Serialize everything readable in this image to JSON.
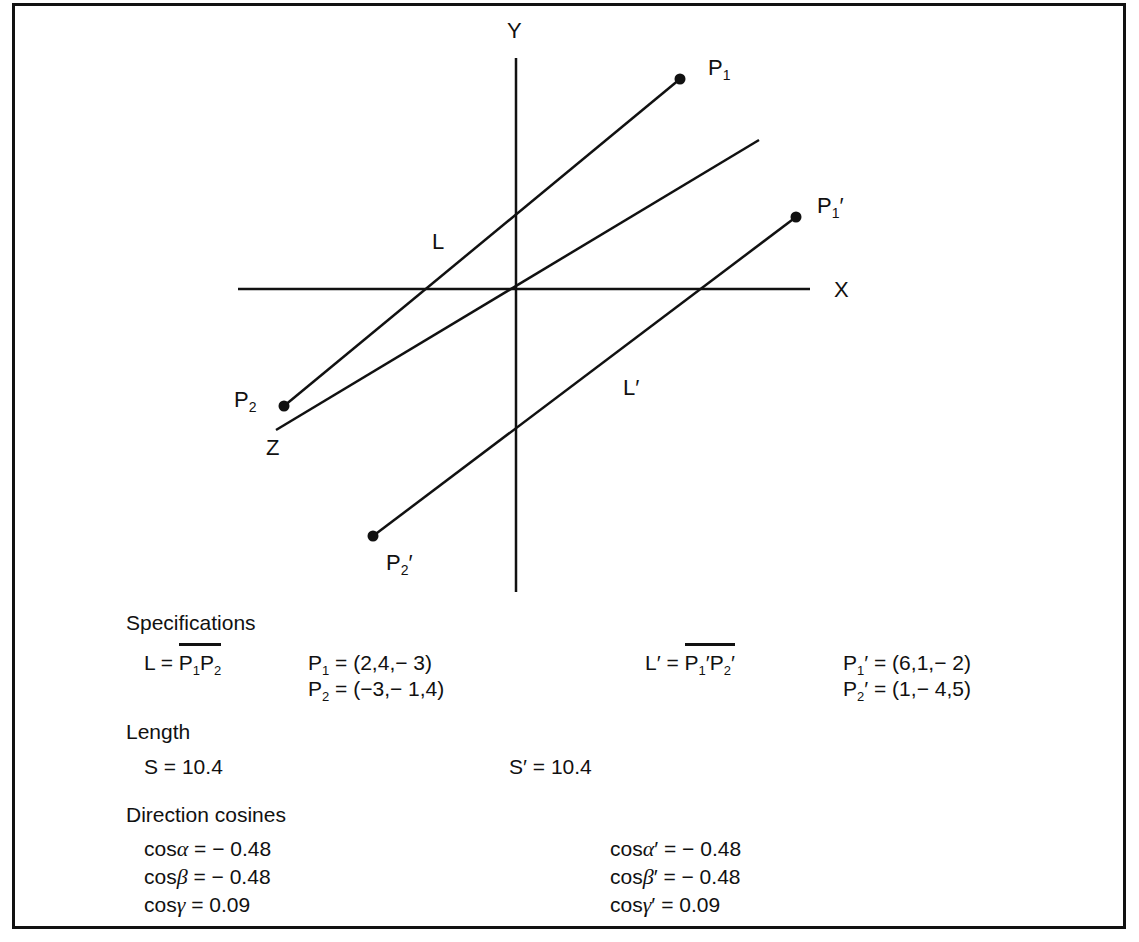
{
  "diagram": {
    "axes": {
      "x_label": "X",
      "y_label": "Y",
      "z_label": "Z"
    },
    "lines": {
      "L_label": "L",
      "Lp_label": "L′"
    },
    "points": {
      "P1": {
        "base": "P",
        "sub": "1",
        "prime": ""
      },
      "P2": {
        "base": "P",
        "sub": "2",
        "prime": ""
      },
      "P1p": {
        "base": "P",
        "sub": "1",
        "prime": "′"
      },
      "P2p": {
        "base": "P",
        "sub": "2",
        "prime": "′"
      }
    }
  },
  "specs": {
    "specifications_heading": "Specifications",
    "L_def_prefix": "L = ",
    "L_def_P": "P",
    "L_def_sub1": "1",
    "L_def_sub2": "2",
    "P1_value": "= (2,4,− 3)",
    "P2_value": "= (−3,− 1,4)",
    "Lp_def_prefix": "L′ = ",
    "Lp_def_P": "P",
    "Lp_def_sub1": "1",
    "Lp_def_sub2": "2",
    "Lp_def_prime": "′",
    "P1p_value": "′ = (6,1,− 2)",
    "P2p_value": "′ = (1,− 4,5)",
    "length_heading": "Length",
    "S": "S = 10.4",
    "Sp": "S′ = 10.4",
    "direction_heading": "Direction cosines",
    "cos_prefix": "cos",
    "alpha": "α",
    "beta": "β",
    "gamma": "γ",
    "cos_alpha_value": " = − 0.48",
    "cos_beta_value": " = − 0.48",
    "cos_gamma_value": " = 0.09",
    "cos_alpha_p_value": "′ = − 0.48",
    "cos_beta_p_value": "′ = − 0.48",
    "cos_gamma_p_value": "′ = 0.09"
  }
}
